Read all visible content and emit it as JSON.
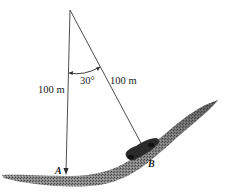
{
  "diagram": {
    "type": "physics-pendulum-on-hill",
    "labels": {
      "vertical_length": "100 m",
      "slant_length": "100 m",
      "angle": "30°",
      "point_a": "A",
      "point_b": "B"
    },
    "colors": {
      "line": "#3a3a3a",
      "ground": "#6e6e6e",
      "ground_dark": "#3c3c3c",
      "car": "#2a2a2a",
      "background": "#ffffff"
    }
  }
}
